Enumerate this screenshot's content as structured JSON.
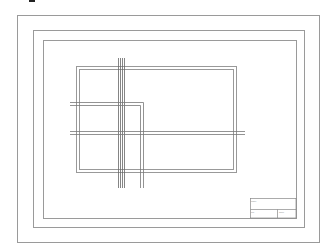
{
  "drawing": {
    "type": "technical-drawing-sheet",
    "colors": {
      "line": "#9a9a9a",
      "dark_line": "#555555",
      "background": "#ffffff",
      "mark": "#222222"
    },
    "frames": {
      "outer": {
        "x": 17,
        "y": 15,
        "w": 302,
        "h": 227
      },
      "middle": {
        "x": 33,
        "y": 30,
        "w": 271,
        "h": 197
      },
      "inner": {
        "x": 43,
        "y": 40,
        "w": 253,
        "h": 178
      }
    },
    "drawing_rect": {
      "outer": {
        "x": 76,
        "y": 66,
        "w": 160,
        "h": 106
      },
      "inner": {
        "x": 79,
        "y": 69,
        "w": 154,
        "h": 100
      }
    },
    "title_block": {
      "x": 250,
      "y": 198,
      "w": 46,
      "h": 20,
      "row_split_y": 209,
      "col_split_x": 277,
      "labels": {
        "top_left": "Name",
        "bottom_left": "Ref",
        "bottom_right": "Scale"
      }
    }
  }
}
